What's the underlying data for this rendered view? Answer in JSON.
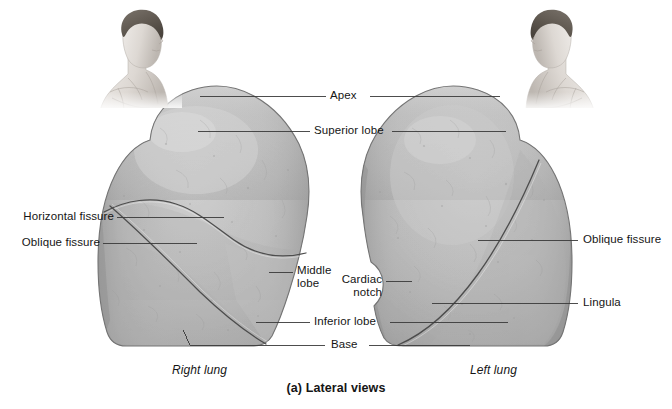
{
  "figure": {
    "caption": "(a) Lateral views",
    "specimen_labels": {
      "left_specimen": "Right lung",
      "right_specimen": "Left lung"
    },
    "colors": {
      "background": "#ffffff",
      "lung_fill_light": "#c6c6c6",
      "lung_fill_mid": "#b2b2b2",
      "lung_fill_dark": "#8f8f8f",
      "outline": "#6d6d6d",
      "fissure_line": "#4a4a4a",
      "leader_line": "#3a3a3a",
      "text": "#151515",
      "skin_light": "#e6e3e0",
      "skin_mid": "#c4bfba",
      "hair_dark": "#5c5650"
    },
    "labels": [
      {
        "id": "apex",
        "text": "Apex"
      },
      {
        "id": "superior-lobe",
        "text": "Superior lobe"
      },
      {
        "id": "horizontal-fissure",
        "text": "Horizontal fissure"
      },
      {
        "id": "oblique-fissure-right",
        "text": "Oblique fissure"
      },
      {
        "id": "middle-lobe",
        "text": "Middle lobe"
      },
      {
        "id": "cardiac-notch",
        "text": "Cardiac notch"
      },
      {
        "id": "inferior-lobe",
        "text": "Inferior lobe"
      },
      {
        "id": "base",
        "text": "Base"
      },
      {
        "id": "oblique-fissure-left",
        "text": "Oblique fissure"
      },
      {
        "id": "lingula",
        "text": "Lingula"
      }
    ],
    "anatomy": {
      "right_lung": {
        "name": "Right lung",
        "lobes": [
          "Superior lobe",
          "Middle lobe",
          "Inferior lobe"
        ],
        "fissures": [
          "Horizontal fissure",
          "Oblique fissure"
        ]
      },
      "left_lung": {
        "name": "Left lung",
        "lobes": [
          "Superior lobe",
          "Inferior lobe"
        ],
        "fissures": [
          "Oblique fissure"
        ],
        "features": [
          "Cardiac notch",
          "Lingula"
        ]
      }
    },
    "orientation_figures": {
      "left": "head-and-torso-facing-right",
      "right": "head-and-torso-facing-left"
    }
  }
}
